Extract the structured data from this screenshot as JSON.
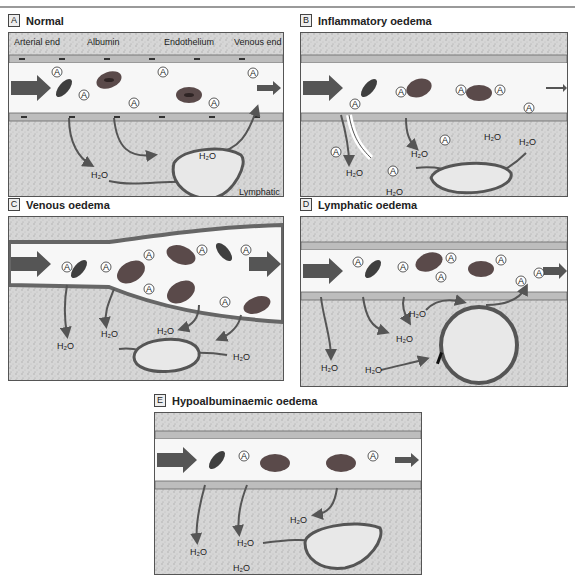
{
  "figure": {
    "panels": [
      {
        "letter": "A",
        "title": "Normal",
        "labels": {
          "arterial_end": "Arterial end",
          "albumin": "Albumin",
          "endothelium": "Endothelium",
          "venous_end": "Venous end",
          "lymphatic": "Lymphatic",
          "water": "H₂O"
        }
      },
      {
        "letter": "B",
        "title": "Inflammatory oedema",
        "labels": {
          "water": "H₂O"
        }
      },
      {
        "letter": "C",
        "title": "Venous oedema",
        "labels": {
          "water": "H₂O"
        }
      },
      {
        "letter": "D",
        "title": "Lymphatic oedema",
        "labels": {
          "water": "H₂O"
        }
      },
      {
        "letter": "E",
        "title": "Hypoalbuminaemic oedema",
        "labels": {
          "water": "H₂O"
        }
      }
    ],
    "albumin_symbol": "A",
    "colors": {
      "tissue": "#d4d4d4",
      "vessel_lumen": "#f7f7f7",
      "endothelium": "#bdbdbd",
      "arrow": "#555555",
      "rbc": "#5a4a4a",
      "platelet": "#3f3f3f"
    }
  }
}
